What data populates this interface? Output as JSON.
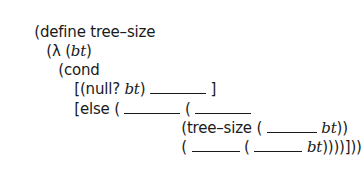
{
  "code": {
    "language": "scheme",
    "lines": [
      {
        "text": "(define tree–size"
      },
      {
        "open": "(",
        "lambda": "λ",
        "space": " (",
        "arg": "bt",
        "close": ")"
      },
      {
        "text": "(cond"
      },
      {
        "open": "[(null? ",
        "arg": "bt",
        "close": ") ",
        "end": " ]"
      },
      {
        "open": "[else ( ",
        "mid": " ( "
      },
      {
        "open": "(tree–size ( ",
        "arg": "bt",
        "close": "))"
      },
      {
        "open": "( ",
        "mid": " ( ",
        "arg": "bt",
        "close": "))))]))"
      }
    ]
  }
}
